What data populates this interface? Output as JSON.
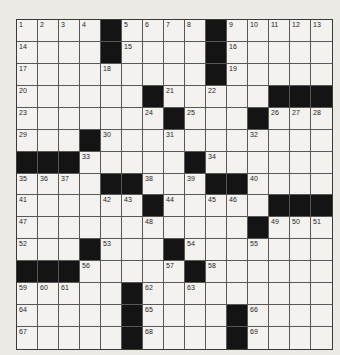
{
  "puzzle": {
    "name": "crossword-grid",
    "rows": 15,
    "cols": 15,
    "first_number": "1",
    "last_number": "69",
    "grid": [
      [
        "1",
        "2",
        "3",
        "4",
        "B",
        "5",
        "6",
        "7",
        "8",
        "B",
        "9",
        "10",
        "11",
        "12",
        "13"
      ],
      [
        "14",
        "",
        "",
        "",
        "B",
        "15",
        "",
        "",
        "",
        "B",
        "16",
        "",
        "",
        "",
        ""
      ],
      [
        "17",
        "",
        "",
        "",
        "18",
        "",
        "",
        "",
        "",
        "B",
        "19",
        "",
        "",
        "",
        ""
      ],
      [
        "20",
        "",
        "",
        "",
        "",
        "",
        "B",
        "21",
        "",
        "22",
        "",
        "",
        "B",
        "B",
        "B"
      ],
      [
        "23",
        "",
        "",
        "",
        "",
        "",
        "24",
        "B",
        "25",
        "",
        "",
        "B",
        "26",
        "27",
        "28"
      ],
      [
        "29",
        "",
        "",
        "B",
        "30",
        "",
        "",
        "31",
        "",
        "",
        "",
        "32",
        "",
        "",
        ""
      ],
      [
        "B",
        "B",
        "B",
        "33",
        "",
        "",
        "",
        "",
        "B",
        "34",
        "",
        "",
        "",
        "",
        ""
      ],
      [
        "35",
        "36",
        "37",
        "",
        "B",
        "B",
        "38",
        "",
        "39",
        "B",
        "B",
        "40",
        "",
        "",
        ""
      ],
      [
        "41",
        "",
        "",
        "",
        "42",
        "43",
        "B",
        "44",
        "",
        "45",
        "46",
        "",
        "B",
        "B",
        "B"
      ],
      [
        "47",
        "",
        "",
        "",
        "",
        "",
        "48",
        "",
        "",
        "",
        "",
        "B",
        "49",
        "50",
        "51"
      ],
      [
        "52",
        "",
        "",
        "B",
        "53",
        "",
        "",
        "B",
        "54",
        "",
        "",
        "55",
        "",
        "",
        ""
      ],
      [
        "B",
        "B",
        "B",
        "56",
        "",
        "",
        "",
        "57",
        "B",
        "58",
        "",
        "",
        "",
        "",
        ""
      ],
      [
        "59",
        "60",
        "61",
        "",
        "",
        "B",
        "62",
        "",
        "63",
        "",
        "",
        "",
        "",
        "",
        ""
      ],
      [
        "64",
        "",
        "",
        "",
        "",
        "B",
        "65",
        "",
        "",
        "",
        "B",
        "66",
        "",
        "",
        ""
      ],
      [
        "67",
        "",
        "",
        "",
        "",
        "B",
        "68",
        "",
        "",
        "",
        "B",
        "69",
        "",
        "",
        ""
      ]
    ],
    "colors": {
      "page_bg": "#ebeae5",
      "cell_bg": "#f3f2ee",
      "black_cell": "#141414",
      "grid_line": "#585858",
      "grid_border": "#3a3a3a",
      "number_color": "#1e1e1e"
    }
  }
}
